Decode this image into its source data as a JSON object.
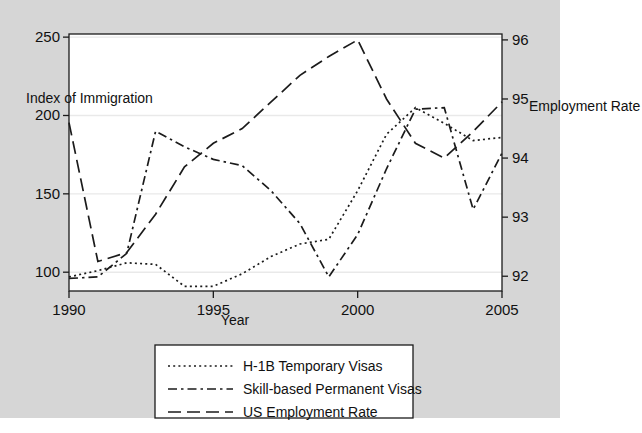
{
  "chart_data": {
    "type": "line",
    "title": "",
    "xlabel": "Year",
    "ylabel": "Index of Immigration",
    "y2label": "Employment Rate",
    "grid": true,
    "legend_position": "bottom",
    "x": [
      1990,
      1991,
      1992,
      1993,
      1994,
      1995,
      1996,
      1997,
      1998,
      1999,
      2000,
      2001,
      2002,
      2003,
      2004,
      2005
    ],
    "xlim": [
      1990,
      2005
    ],
    "xticks": [
      1990,
      1995,
      2000,
      2005
    ],
    "xtick_labels": [
      "1990",
      "1995",
      "2000",
      "2005"
    ],
    "ylim": [
      88,
      252
    ],
    "yticks": [
      100,
      150,
      200,
      250
    ],
    "ytick_labels": [
      "100",
      "150",
      "200",
      "250"
    ],
    "y2lim": [
      91.75,
      96.1
    ],
    "y2ticks": [
      92,
      93,
      94,
      95,
      96
    ],
    "y2tick_labels": [
      "92",
      "93",
      "94",
      "95",
      "96"
    ],
    "series": [
      {
        "name": "H-1B Temporary Visas",
        "axis": "left",
        "dash": "dotted",
        "values": [
          97,
          101,
          106,
          105,
          91,
          91,
          99,
          110,
          118,
          121,
          152,
          188,
          205,
          195,
          184,
          186
        ]
      },
      {
        "name": "Skill-based Permanent Visas",
        "axis": "left",
        "dash": "dash-dot",
        "values": [
          96,
          97,
          112,
          190,
          180,
          172,
          168,
          152,
          131,
          97,
          124,
          166,
          204,
          205,
          140,
          176
        ]
      },
      {
        "name": "US Employment Rate",
        "axis": "right",
        "dash": "long-dash",
        "values": [
          94.6,
          92.25,
          92.4,
          93.05,
          93.85,
          94.25,
          94.5,
          94.95,
          95.4,
          95.72,
          96.0,
          95.0,
          94.25,
          94.0,
          94.45,
          94.95
        ]
      }
    ]
  },
  "axes": {
    "left_title": "Index of Immigration",
    "right_title": "Employment Rate",
    "x_title": "Year"
  },
  "legend": {
    "items": [
      {
        "label": "H-1B Temporary Visas",
        "dash": "dotted"
      },
      {
        "label": "Skill-based Permanent Visas",
        "dash": "dash-dot"
      },
      {
        "label": "US Employment Rate",
        "dash": "long-dash"
      }
    ]
  },
  "colors": {
    "panel_background": "#d6d6d6",
    "plot_background": "#ffffff",
    "line": "#1b1b1b",
    "grid": "#e9e9e9",
    "axis": "#1b1b1b",
    "page_background": "#ffffff"
  }
}
